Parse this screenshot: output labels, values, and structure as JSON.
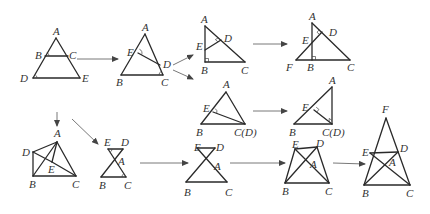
{
  "diagram": {
    "figures": [
      {
        "id": "fig1",
        "points": {
          "A": [
            56,
            38
          ],
          "B": [
            45,
            56
          ],
          "C": [
            68,
            56
          ],
          "D": [
            33,
            78
          ],
          "E": [
            80,
            78
          ]
        },
        "segments": [
          [
            "A",
            "D"
          ],
          [
            "A",
            "E"
          ],
          [
            "D",
            "E"
          ],
          [
            "B",
            "C"
          ]
        ],
        "angle_marks": [
          "B",
          "D"
        ],
        "labels": [
          {
            "text": "A",
            "x": 53,
            "y": 35
          },
          {
            "text": "B",
            "x": 35,
            "y": 59
          },
          {
            "text": "C",
            "x": 69,
            "y": 59
          },
          {
            "text": "D",
            "x": 20,
            "y": 82
          },
          {
            "text": "E",
            "x": 82,
            "y": 82
          }
        ]
      },
      {
        "id": "fig2",
        "points": {
          "A": [
            145,
            34
          ],
          "E": [
            138,
            53
          ],
          "D": [
            160,
            65
          ],
          "B": [
            121,
            75
          ],
          "C": [
            163,
            75
          ]
        },
        "segments": [
          [
            "A",
            "B"
          ],
          [
            "A",
            "C"
          ],
          [
            "B",
            "C"
          ],
          [
            "E",
            "D"
          ]
        ],
        "angle_marks": [
          "E",
          "C"
        ],
        "labels": [
          {
            "text": "A",
            "x": 142,
            "y": 31
          },
          {
            "text": "E",
            "x": 127,
            "y": 56
          },
          {
            "text": "D",
            "x": 163,
            "y": 68
          },
          {
            "text": "B",
            "x": 116,
            "y": 86
          },
          {
            "text": "C",
            "x": 161,
            "y": 86
          }
        ]
      },
      {
        "id": "fig3",
        "points": {
          "A": [
            205,
            26
          ],
          "E": [
            205,
            50
          ],
          "D": [
            221,
            40
          ],
          "B": [
            205,
            62
          ],
          "C": [
            245,
            62
          ]
        },
        "segments": [
          [
            "A",
            "B"
          ],
          [
            "A",
            "C"
          ],
          [
            "B",
            "C"
          ],
          [
            "E",
            "D"
          ]
        ],
        "right_angles": [
          "D",
          "B"
        ],
        "labels": [
          {
            "text": "A",
            "x": 201,
            "y": 23
          },
          {
            "text": "E",
            "x": 196,
            "y": 50
          },
          {
            "text": "D",
            "x": 224,
            "y": 42
          },
          {
            "text": "B",
            "x": 201,
            "y": 74
          },
          {
            "text": "C",
            "x": 241,
            "y": 74
          }
        ]
      },
      {
        "id": "fig4",
        "points": {
          "A": [
            312,
            23
          ],
          "E": [
            312,
            44
          ],
          "D": [
            322,
            32
          ],
          "F": [
            296,
            60
          ],
          "B": [
            312,
            60
          ],
          "C": [
            350,
            60
          ]
        },
        "segments": [
          [
            "A",
            "B"
          ],
          [
            "A",
            "C"
          ],
          [
            "F",
            "C"
          ],
          [
            "F",
            "D"
          ]
        ],
        "right_angles": [
          "D",
          "B"
        ],
        "labels": [
          {
            "text": "A",
            "x": 309,
            "y": 20
          },
          {
            "text": "E",
            "x": 302,
            "y": 44
          },
          {
            "text": "D",
            "x": 329,
            "y": 36
          },
          {
            "text": "F",
            "x": 286,
            "y": 71
          },
          {
            "text": "B",
            "x": 307,
            "y": 71
          },
          {
            "text": "C",
            "x": 347,
            "y": 71
          }
        ]
      },
      {
        "id": "fig5",
        "points": {
          "A": [
            226,
            92
          ],
          "E": [
            213,
            112
          ],
          "B": [
            201,
            124
          ],
          "C": [
            245,
            124
          ]
        },
        "segments": [
          [
            "A",
            "B"
          ],
          [
            "A",
            "C"
          ],
          [
            "B",
            "C"
          ],
          [
            "E",
            "C"
          ]
        ],
        "angle_marks": [
          "E"
        ],
        "labels": [
          {
            "text": "A",
            "x": 223,
            "y": 88
          },
          {
            "text": "E",
            "x": 203,
            "y": 112
          },
          {
            "text": "B",
            "x": 196,
            "y": 136
          },
          {
            "text": "C(D)",
            "x": 234,
            "y": 136
          }
        ]
      },
      {
        "id": "fig6",
        "points": {
          "A": [
            332,
            87
          ],
          "E": [
            314,
            110
          ],
          "B": [
            294,
            124
          ],
          "C": [
            332,
            124
          ]
        },
        "segments": [
          [
            "A",
            "B"
          ],
          [
            "A",
            "C"
          ],
          [
            "B",
            "C"
          ],
          [
            "E",
            "C"
          ]
        ],
        "right_angles": [
          "E",
          "C"
        ],
        "labels": [
          {
            "text": "A",
            "x": 329,
            "y": 84
          },
          {
            "text": "E",
            "x": 302,
            "y": 111
          },
          {
            "text": "B",
            "x": 289,
            "y": 136
          },
          {
            "text": "C(D)",
            "x": 322,
            "y": 136
          }
        ]
      },
      {
        "id": "fig7",
        "points": {
          "A": [
            57,
            142
          ],
          "D": [
            33,
            152
          ],
          "E": [
            52,
            162
          ],
          "B": [
            33,
            176
          ],
          "C": [
            76,
            176
          ]
        },
        "segments": [
          [
            "A",
            "D"
          ],
          [
            "A",
            "B"
          ],
          [
            "A",
            "C"
          ],
          [
            "A",
            "E"
          ],
          [
            "D",
            "B"
          ],
          [
            "B",
            "C"
          ],
          [
            "D",
            "E"
          ],
          [
            "E",
            "C"
          ]
        ],
        "labels": [
          {
            "text": "A",
            "x": 54,
            "y": 137
          },
          {
            "text": "D",
            "x": 22,
            "y": 156
          },
          {
            "text": "E",
            "x": 48,
            "y": 173
          },
          {
            "text": "B",
            "x": 29,
            "y": 188
          },
          {
            "text": "C",
            "x": 72,
            "y": 188
          }
        ]
      },
      {
        "id": "fig8",
        "points": {
          "E": [
            108,
            149
          ],
          "D": [
            123,
            149
          ],
          "A": [
            114,
            160
          ],
          "B": [
            101,
            177
          ],
          "C": [
            126,
            177
          ]
        },
        "segments": [
          [
            "E",
            "D"
          ],
          [
            "E",
            "C"
          ],
          [
            "D",
            "B"
          ],
          [
            "B",
            "C"
          ]
        ],
        "angle_marks": [
          "E",
          "C"
        ],
        "labels": [
          {
            "text": "E",
            "x": 104,
            "y": 146
          },
          {
            "text": "D",
            "x": 121,
            "y": 146
          },
          {
            "text": "A",
            "x": 118,
            "y": 165
          },
          {
            "text": "B",
            "x": 99,
            "y": 189
          },
          {
            "text": "C",
            "x": 124,
            "y": 189
          }
        ]
      },
      {
        "id": "fig9",
        "points": {
          "E": [
            197,
            148
          ],
          "D": [
            215,
            148
          ],
          "A": [
            209,
            163
          ],
          "B": [
            186,
            182
          ],
          "C": [
            227,
            182
          ]
        },
        "segments": [
          [
            "E",
            "D"
          ],
          [
            "E",
            "C"
          ],
          [
            "D",
            "B"
          ],
          [
            "B",
            "C"
          ]
        ],
        "labels": [
          {
            "text": "E",
            "x": 194,
            "y": 151
          },
          {
            "text": "D",
            "x": 216,
            "y": 151
          },
          {
            "text": "A",
            "x": 214,
            "y": 170
          },
          {
            "text": "B",
            "x": 184,
            "y": 196
          },
          {
            "text": "C",
            "x": 225,
            "y": 196
          }
        ]
      },
      {
        "id": "fig10",
        "points": {
          "E": [
            295,
            149
          ],
          "D": [
            317,
            147
          ],
          "A": [
            308,
            162
          ],
          "B": [
            285,
            183
          ],
          "C": [
            329,
            183
          ]
        },
        "segments": [
          [
            "E",
            "D"
          ],
          [
            "E",
            "B"
          ],
          [
            "D",
            "C"
          ],
          [
            "E",
            "C"
          ],
          [
            "D",
            "B"
          ],
          [
            "B",
            "C"
          ]
        ],
        "labels": [
          {
            "text": "E",
            "x": 292,
            "y": 148
          },
          {
            "text": "D",
            "x": 316,
            "y": 147
          },
          {
            "text": "A",
            "x": 310,
            "y": 168
          },
          {
            "text": "B",
            "x": 282,
            "y": 195
          },
          {
            "text": "C",
            "x": 325,
            "y": 195
          }
        ]
      },
      {
        "id": "fig11",
        "points": {
          "F": [
            386,
            118
          ],
          "E": [
            370,
            153
          ],
          "D": [
            398,
            152
          ],
          "A": [
            387,
            163
          ],
          "B": [
            364,
            185
          ],
          "C": [
            410,
            185
          ]
        },
        "segments": [
          [
            "F",
            "B"
          ],
          [
            "F",
            "C"
          ],
          [
            "B",
            "C"
          ],
          [
            "E",
            "D"
          ],
          [
            "E",
            "C"
          ],
          [
            "D",
            "B"
          ]
        ],
        "labels": [
          {
            "text": "F",
            "x": 382,
            "y": 113
          },
          {
            "text": "E",
            "x": 362,
            "y": 156
          },
          {
            "text": "D",
            "x": 400,
            "y": 152
          },
          {
            "text": "A",
            "x": 389,
            "y": 166
          },
          {
            "text": "B",
            "x": 362,
            "y": 197
          },
          {
            "text": "C",
            "x": 406,
            "y": 197
          }
        ]
      }
    ],
    "arrows": [
      {
        "from": [
          77,
          59
        ],
        "to": [
          118,
          59
        ]
      },
      {
        "from": [
          173,
          65
        ],
        "to": [
          193,
          55
        ]
      },
      {
        "from": [
          173,
          70
        ],
        "to": [
          193,
          79
        ]
      },
      {
        "from": [
          253,
          44
        ],
        "to": [
          287,
          44
        ]
      },
      {
        "from": [
          253,
          111
        ],
        "to": [
          287,
          111
        ]
      },
      {
        "from": [
          57,
          112
        ],
        "to": [
          57,
          126
        ]
      },
      {
        "from": [
          72,
          119
        ],
        "to": [
          98,
          144
        ]
      },
      {
        "from": [
          140,
          163
        ],
        "to": [
          188,
          163
        ]
      },
      {
        "from": [
          230,
          163
        ],
        "to": [
          285,
          163
        ]
      },
      {
        "from": [
          333,
          163
        ],
        "to": [
          365,
          164
        ]
      }
    ]
  }
}
